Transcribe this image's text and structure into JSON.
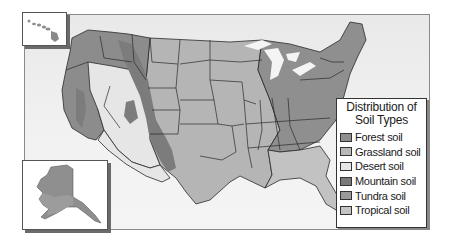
{
  "legend": {
    "title_line1": "Distribution of",
    "title_line2": "Soil Types",
    "items": [
      {
        "label": "Forest soil",
        "color": "#8f8f8f"
      },
      {
        "label": "Grassland soil",
        "color": "#b8b8b8"
      },
      {
        "label": "Desert soil",
        "color": "#e6e6e6"
      },
      {
        "label": "Mountain soil",
        "color": "#7a7a7a"
      },
      {
        "label": "Tundra soil",
        "color": "#9a9a9a"
      },
      {
        "label": "Tropical soil",
        "color": "#c4c4c4"
      }
    ]
  },
  "insets": {
    "hawaii": "Hawaii",
    "alaska": "Alaska"
  },
  "colors": {
    "forest": "#8f8f8f",
    "grassland": "#b8b8b8",
    "desert": "#e8e8e8",
    "mountain": "#7c7c7c",
    "tundra": "#9a9a9a",
    "tropical": "#c4c4c4",
    "water": "#f0f0f0",
    "border": "#2a2a2a"
  }
}
